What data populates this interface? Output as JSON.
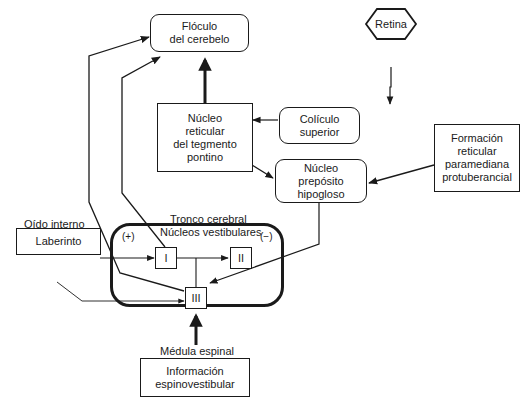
{
  "diagram": {
    "nodes": {
      "floculo": {
        "label": "Flóculo\ndel cerebelo",
        "line1": "Flóculo",
        "line2": "del cerebelo"
      },
      "retina": {
        "label": "Retina"
      },
      "coliculo": {
        "line1": "Colículo",
        "line2": "superior"
      },
      "nrtp": {
        "line1": "Núcleo",
        "line2": "reticular",
        "line3": "del tegmento",
        "line4": "pontino"
      },
      "preposito": {
        "line1": "Núcleo",
        "line2": "prepósito",
        "line3": "hipogloso"
      },
      "fprp": {
        "line1": "Formación",
        "line2": "reticular",
        "line3": "paramediana",
        "line4": "protuberancial"
      },
      "laberinto": {
        "label": "Laberinto"
      },
      "tronco": {
        "line1": "Tronco cerebral",
        "line2": "Núcleos vestibulares"
      },
      "oido": {
        "label": "Oído interno"
      },
      "nucleus_I": {
        "label": "I"
      },
      "nucleus_II": {
        "label": "II"
      },
      "nucleus_III": {
        "label": "III"
      },
      "plus": {
        "label": "(+)"
      },
      "minus": {
        "label": "(−)"
      },
      "medula": {
        "label": "Médula espinal"
      },
      "espino": {
        "line1": "Información",
        "line2": "espinovestibular"
      }
    },
    "edges": [
      {
        "from": "Núcleo reticular del tegmento pontino",
        "to": "Flóculo del cerebelo",
        "style": "thick"
      },
      {
        "from": "Retina",
        "to": "Colículo superior"
      },
      {
        "from": "Colículo superior",
        "to": "Núcleo reticular del tegmento pontino"
      },
      {
        "from": "Núcleo reticular del tegmento pontino",
        "to": "Núcleo prepósito hipogloso"
      },
      {
        "from": "Formación reticular paramediana protuberancial",
        "to": "Núcleo prepósito hipogloso"
      },
      {
        "from": "Núcleo prepósito hipogloso",
        "to": "III"
      },
      {
        "from": "Laberinto",
        "to": "I"
      },
      {
        "from": "Laberinto",
        "to": "III"
      },
      {
        "from": "I",
        "to": "II"
      },
      {
        "from": "I",
        "to": "Flóculo del cerebelo"
      },
      {
        "from": "III",
        "to": "Flóculo del cerebelo"
      },
      {
        "from": "Información espinovestibular",
        "to": "III",
        "style": "thick"
      }
    ]
  }
}
